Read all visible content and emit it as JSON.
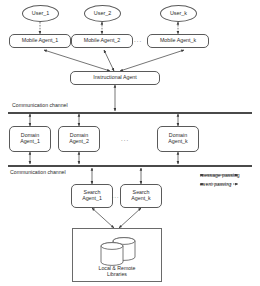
{
  "diagram": {
    "users": [
      {
        "label": "User_1"
      },
      {
        "label": "User_2"
      },
      {
        "label": "User_k"
      }
    ],
    "mobile_agents": [
      {
        "label": "Mobile Agent_1"
      },
      {
        "label": "Mobile Agent_2"
      },
      {
        "label": "Mobile Agent_k"
      }
    ],
    "instructional_agent": {
      "label": "Instructional Agent"
    },
    "channels": [
      {
        "label": "Communication channel"
      },
      {
        "label": "Communication channel"
      }
    ],
    "domain_agents": [
      {
        "label": "Domain\nAgent_1"
      },
      {
        "label": "Domain\nAgent_2"
      },
      {
        "label": "Domain\nAgent_k"
      }
    ],
    "search_agents": [
      {
        "label": "Search\nAgent_1"
      },
      {
        "label": "Search\nAgent_k"
      }
    ],
    "library": {
      "label": "Local & Remote\nLibraries"
    },
    "ellipsis": "...",
    "legend": [
      {
        "key": "message-passing",
        "label": "message passing",
        "style": "solid"
      },
      {
        "key": "event-passing",
        "label": "event passing",
        "style": "dashed"
      }
    ],
    "colors": {
      "stroke": "#5a5a5a",
      "bar": "#4a4a4a",
      "text": "#2b2b2b",
      "background": "#ffffff"
    }
  }
}
